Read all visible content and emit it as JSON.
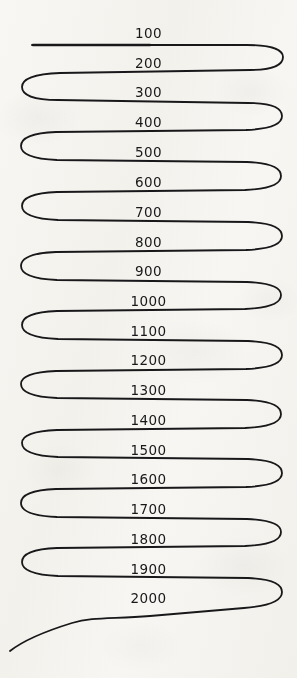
{
  "document": {
    "kind": "hand-drawn-serpentine-number-line",
    "title": "",
    "background_color": "#fbfaf8",
    "ink_color": "#18181a"
  },
  "drawing": {
    "name": "serpentine-line",
    "description": "A single continuous hand-drawn line snaking back and forth across the page in twenty horizontal passes, turning around with rounded U-bends at alternating right and left margins, beginning with a blunt stroke at the upper left and finishing as an open tail curving down to the lower left.",
    "stroke_color": "#18181a",
    "stroke_width": 1.8,
    "start_point": {
      "x": 32,
      "y": 45
    },
    "end_point": {
      "x": 10,
      "y": 651
    },
    "pass_count": 20,
    "left_margin": 22,
    "right_margin": 281,
    "path": "M 32 45 L 247 45 C 272 45 283 50 283 57 C 283 65 272 70 250 70 L 60 73 C 34 74 22 79 22 87 C 22 95 34 100 58 100 L 248 103 C 272 103 282 108 282 116 C 282 124 270 129 246 130 L 56 132 C 32 133 21 138 21 146 C 21 154 33 159 57 160 L 247 162 C 271 163 281 168 281 176 C 281 184 269 189 245 190 L 57 192 C 33 193 22 198 22 206 C 22 214 34 219 58 220 L 248 222 C 272 223 282 228 282 236 C 282 244 270 249 246 250 L 56 252 C 32 253 21 258 21 266 C 21 274 33 279 57 280 L 247 282 C 271 283 281 288 281 295 C 281 303 269 308 245 309 L 57 311 C 33 312 22 317 22 325 C 22 333 34 338 58 339 L 248 341 C 272 342 282 347 282 355 C 282 363 270 368 246 369 L 56 371 C 32 372 21 377 21 384 C 21 392 33 397 57 398 L 247 400 C 271 401 281 406 281 414 C 281 422 269 427 245 428 L 57 430 C 33 431 22 436 22 443 C 22 451 34 456 58 457 L 248 459 C 272 460 282 465 282 473 C 282 481 270 486 246 487 L 56 489 C 32 490 21 495 21 503 C 21 511 33 516 57 517 L 247 519 C 271 520 281 525 281 532 C 281 540 269 545 245 546 L 57 548 C 33 549 22 554 22 562 C 22 570 34 575 58 576 L 248 578 C 272 579 282 584 282 592 C 282 600 270 606 244 608 L 150 616 C 110 619 92 617 72 623 C 46 631 24 640 10 651",
    "turns": [
      {
        "side": "right",
        "row": 2
      },
      {
        "side": "left",
        "row": 3
      },
      {
        "side": "right",
        "row": 4
      },
      {
        "side": "left",
        "row": 5
      },
      {
        "side": "right",
        "row": 6
      },
      {
        "side": "left",
        "row": 7
      },
      {
        "side": "right",
        "row": 8
      },
      {
        "side": "left",
        "row": 9
      },
      {
        "side": "right",
        "row": 10
      },
      {
        "side": "left",
        "row": 11
      },
      {
        "side": "right",
        "row": 12
      },
      {
        "side": "left",
        "row": 13
      },
      {
        "side": "right",
        "row": 14
      },
      {
        "side": "left",
        "row": 15
      },
      {
        "side": "right",
        "row": 16
      },
      {
        "side": "left",
        "row": 17
      },
      {
        "side": "right",
        "row": 18
      },
      {
        "side": "left",
        "row": 19
      },
      {
        "side": "right",
        "row": 20
      }
    ]
  },
  "labels": [
    {
      "text": "100",
      "x": 150,
      "y": 33
    },
    {
      "text": "200",
      "x": 150,
      "y": 63
    },
    {
      "text": "300",
      "x": 150,
      "y": 92
    },
    {
      "text": "400",
      "x": 150,
      "y": 122
    },
    {
      "text": "500",
      "x": 150,
      "y": 152
    },
    {
      "text": "600",
      "x": 150,
      "y": 182
    },
    {
      "text": "700",
      "x": 150,
      "y": 212
    },
    {
      "text": "800",
      "x": 150,
      "y": 242
    },
    {
      "text": "900",
      "x": 150,
      "y": 271
    },
    {
      "text": "1000",
      "x": 150,
      "y": 301
    },
    {
      "text": "1100",
      "x": 150,
      "y": 331
    },
    {
      "text": "1200",
      "x": 150,
      "y": 360
    },
    {
      "text": "1300",
      "x": 150,
      "y": 390
    },
    {
      "text": "1400",
      "x": 150,
      "y": 420
    },
    {
      "text": "1500",
      "x": 150,
      "y": 450
    },
    {
      "text": "1600",
      "x": 150,
      "y": 479
    },
    {
      "text": "1700",
      "x": 150,
      "y": 509
    },
    {
      "text": "1800",
      "x": 150,
      "y": 539
    },
    {
      "text": "1900",
      "x": 150,
      "y": 569
    },
    {
      "text": "2000",
      "x": 150,
      "y": 598
    }
  ]
}
